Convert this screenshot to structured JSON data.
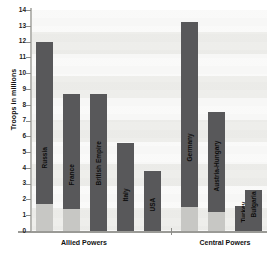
{
  "chart_data": {
    "type": "bar",
    "title": "",
    "xlabel": "",
    "ylabel": "Troops in millions",
    "ylim": [
      0,
      14
    ],
    "ytick_labels": [
      "14",
      "13",
      "12",
      "11",
      "10",
      "9",
      "8",
      "7",
      "6",
      "5",
      "4",
      "3",
      "2",
      "1",
      "0"
    ],
    "ytick_values": [
      14,
      13,
      12,
      11,
      10,
      9,
      8,
      7,
      6,
      5,
      4,
      3,
      2,
      1,
      0
    ],
    "grid": true,
    "legend": "none",
    "groups": [
      {
        "name": "Allied Powers",
        "categories": [
          "Russia",
          "France",
          "British Empire",
          "Italy",
          "USA"
        ],
        "values": [
          12.0,
          8.66,
          8.7,
          5.6,
          3.8
        ],
        "base_values": [
          1.7,
          1.4,
          0.0,
          0.0,
          0.0
        ]
      },
      {
        "name": "Central Powers",
        "categories": [
          "Germany",
          "Austria-Hungary",
          "Turkey",
          "Bulgaria"
        ],
        "values": [
          13.25,
          7.55,
          1.6,
          2.6
        ],
        "base_values": [
          1.5,
          1.2,
          0.0,
          0.0
        ]
      }
    ],
    "series": [
      {
        "name": "Troops mobilised",
        "values": [
          12.0,
          8.66,
          8.7,
          5.6,
          3.8,
          13.25,
          7.55,
          1.6,
          2.6
        ]
      }
    ],
    "categories": [
      "Russia",
      "France",
      "British Empire",
      "Italy",
      "USA",
      "Germany",
      "Austria-Hungary",
      "Turkey",
      "Bulgaria"
    ],
    "colors": {
      "bar": "#58585a",
      "bar_base": "#c7c7c4",
      "axis": "#9a9a96",
      "plot_background": "#f0f0ee",
      "text": "#111111"
    }
  }
}
